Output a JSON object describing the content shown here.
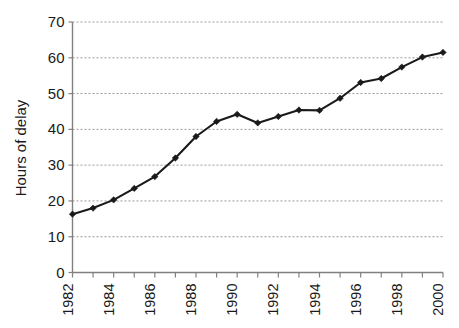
{
  "chart_data": {
    "type": "line",
    "title": "",
    "subtitle": "",
    "xlabel": "",
    "ylabel": "Hours of delay",
    "x": [
      1982,
      1983,
      1984,
      1985,
      1986,
      1987,
      1988,
      1989,
      1990,
      1991,
      1992,
      1993,
      1994,
      1995,
      1996,
      1997,
      1998,
      1999,
      2000
    ],
    "values": [
      16.3,
      18.0,
      20.3,
      23.5,
      26.8,
      32.0,
      38.0,
      42.2,
      44.2,
      41.8,
      43.6,
      45.4,
      45.3,
      48.7,
      53.1,
      54.2,
      57.4,
      60.2,
      61.5
    ],
    "series": [
      {
        "name": "Hours of delay",
        "values": [
          16.3,
          18.0,
          20.3,
          23.5,
          26.8,
          32.0,
          38.0,
          42.2,
          44.2,
          41.8,
          43.6,
          45.4,
          45.3,
          48.7,
          53.1,
          54.2,
          57.4,
          60.2,
          61.5
        ]
      }
    ],
    "xlim": [
      1982,
      2000
    ],
    "ylim": [
      0,
      70
    ],
    "ytick_labels": [
      "0",
      "10",
      "20",
      "30",
      "40",
      "50",
      "60",
      "70"
    ],
    "ytick_values": [
      0,
      10,
      20,
      30,
      40,
      50,
      60,
      70
    ],
    "xtick_labels": [
      "1982",
      "1984",
      "1986",
      "1988",
      "1990",
      "1992",
      "1994",
      "1996",
      "1998",
      "2000"
    ],
    "xtick_values": [
      1982,
      1984,
      1986,
      1988,
      1990,
      1992,
      1994,
      1996,
      1998,
      2000
    ],
    "xtick_minor_values": [
      1983,
      1985,
      1987,
      1989,
      1991,
      1993,
      1995,
      1997,
      1999
    ],
    "grid": "horizontal-dashed",
    "legend": "none",
    "marker": "diamond",
    "colors": {
      "line": "#1a1a1a",
      "marker": "#1a1a1a",
      "grid": "#9a9a9a",
      "axis": "#808080",
      "background": "#ffffff",
      "text": "#1a1a1a"
    }
  }
}
